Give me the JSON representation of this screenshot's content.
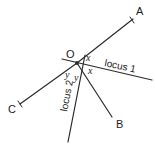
{
  "figure": {
    "type": "geometry-diagram",
    "background_color": "#ffffff",
    "stroke_color": "#2b2b2b",
    "text_color": "#1c1c1c",
    "vertex": {
      "label": "O",
      "x": 77,
      "y": 63,
      "label_x": 66,
      "label_y": 58
    },
    "points": [
      {
        "name": "point-a",
        "label": "A",
        "x": 133,
        "y": 19,
        "label_x": 136,
        "label_y": 15
      },
      {
        "name": "point-b",
        "label": "B",
        "x": 112,
        "y": 117,
        "label_x": 116,
        "label_y": 128
      },
      {
        "name": "point-c",
        "label": "C",
        "x": 20,
        "y": 104,
        "label_x": 8,
        "label_y": 113
      }
    ],
    "rays": [
      {
        "name": "ray-oa",
        "x1": 77,
        "y1": 63,
        "x2": 133,
        "y2": 19
      },
      {
        "name": "ray-oc",
        "x1": 77,
        "y1": 63,
        "x2": 20,
        "y2": 104
      },
      {
        "name": "ray-ob",
        "x1": 77,
        "y1": 63,
        "x2": 112,
        "y2": 117
      }
    ],
    "loci": [
      {
        "name": "locus-1",
        "label": "locus 1",
        "x1": 62,
        "y1": 59,
        "x2": 152,
        "y2": 80,
        "label_x": 104,
        "label_y": 66,
        "label_rotation": 12
      },
      {
        "name": "locus-2",
        "label": "locus 2",
        "x1": 85,
        "y1": 55,
        "x2": 68,
        "y2": 142,
        "label_x": 67,
        "label_y": 112,
        "label_rotation": -79
      }
    ],
    "angle_labels": [
      {
        "name": "angle-x-upper",
        "label": "x",
        "x": 86,
        "y": 61
      },
      {
        "name": "angle-x-lower",
        "label": "x",
        "x": 88,
        "y": 74
      },
      {
        "name": "angle-y-left",
        "label": "y",
        "x": 65,
        "y": 78
      },
      {
        "name": "angle-y-right",
        "label": "y",
        "x": 74,
        "y": 81
      }
    ],
    "ticks": [
      {
        "name": "tick-a",
        "x1": 130,
        "y1": 17,
        "x2": 134,
        "y2": 23
      },
      {
        "name": "tick-c",
        "x1": 18,
        "y1": 101,
        "x2": 22,
        "y2": 107
      }
    ]
  }
}
